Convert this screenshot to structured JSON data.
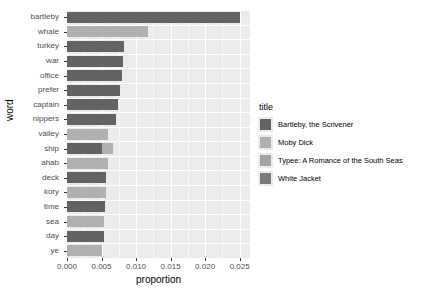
{
  "chart_data": {
    "type": "bar",
    "orientation": "horizontal",
    "stacked": true,
    "title": "",
    "xlabel": "proportion",
    "ylabel": "word",
    "xlim": [
      0,
      0.0265
    ],
    "xticks": [
      0.0,
      0.005,
      0.01,
      0.015,
      0.02,
      0.025
    ],
    "xticklabels": [
      "0.000",
      "0.005",
      "0.010",
      "0.015",
      "0.020",
      "0.025"
    ],
    "categories": [
      "bartleby",
      "whale",
      "turkey",
      "war",
      "office",
      "prefer",
      "captain",
      "nippers",
      "valley",
      "ship",
      "ahab",
      "deck",
      "kory",
      "time",
      "sea",
      "day",
      "ye"
    ],
    "legend_title": "title",
    "legend_position": "right",
    "grid": true,
    "panel_background": "#ebebeb",
    "series": [
      {
        "name": "Bartleby, the Scrivener",
        "color": "#636363",
        "values": [
          0.025,
          0,
          0.0083,
          0.00805,
          0.0079,
          0.00765,
          0.0074,
          0.00715,
          0,
          0.005,
          0,
          0.0057,
          0,
          0.00545,
          0,
          0.0053,
          0
        ]
      },
      {
        "name": "Moby Dick",
        "color": "#b0b0b0",
        "values": [
          0,
          0.0118,
          0,
          0,
          0,
          0,
          0,
          0,
          0.006,
          0.005,
          0.0059,
          0,
          0.0056,
          0,
          0.0054,
          0,
          0.00505
        ]
      },
      {
        "name": "Typee: A Romance of the South Seas",
        "color": "#a3a3a3",
        "values": [
          0,
          0,
          0,
          0,
          0,
          0,
          0,
          0,
          0,
          0,
          0,
          0,
          0,
          0,
          0,
          0,
          0
        ]
      },
      {
        "name": "White Jacket",
        "color": "#7a7a7a",
        "values": [
          0,
          0,
          0,
          0,
          0,
          0,
          0,
          0,
          0,
          0,
          0,
          0,
          0,
          0,
          0,
          0,
          0
        ]
      }
    ],
    "bars": [
      {
        "word": "bartleby",
        "segments": [
          {
            "series": "Bartleby, the Scrivener",
            "value": 0.025
          }
        ]
      },
      {
        "word": "whale",
        "segments": [
          {
            "series": "Moby Dick",
            "value": 0.0118
          }
        ]
      },
      {
        "word": "turkey",
        "segments": [
          {
            "series": "Bartleby, the Scrivener",
            "value": 0.0083
          }
        ]
      },
      {
        "word": "war",
        "segments": [
          {
            "series": "Bartleby, the Scrivener",
            "value": 0.00805
          }
        ]
      },
      {
        "word": "office",
        "segments": [
          {
            "series": "Bartleby, the Scrivener",
            "value": 0.0079
          }
        ]
      },
      {
        "word": "prefer",
        "segments": [
          {
            "series": "Bartleby, the Scrivener",
            "value": 0.00765
          }
        ]
      },
      {
        "word": "captain",
        "segments": [
          {
            "series": "Bartleby, the Scrivener",
            "value": 0.0074
          }
        ]
      },
      {
        "word": "nippers",
        "segments": [
          {
            "series": "Bartleby, the Scrivener",
            "value": 0.00715
          }
        ]
      },
      {
        "word": "valley",
        "segments": [
          {
            "series": "Moby Dick",
            "value": 0.006
          }
        ]
      },
      {
        "word": "ship",
        "segments": [
          {
            "series": "Bartleby, the Scrivener",
            "value": 0.005
          },
          {
            "series": "Moby Dick",
            "value": 0.0066
          }
        ]
      },
      {
        "word": "ahab",
        "segments": [
          {
            "series": "Moby Dick",
            "value": 0.0059
          }
        ]
      },
      {
        "word": "deck",
        "segments": [
          {
            "series": "Bartleby, the Scrivener",
            "value": 0.0057
          }
        ]
      },
      {
        "word": "kory",
        "segments": [
          {
            "series": "Moby Dick",
            "value": 0.0056
          }
        ]
      },
      {
        "word": "time",
        "segments": [
          {
            "series": "Bartleby, the Scrivener",
            "value": 0.00545
          }
        ]
      },
      {
        "word": "sea",
        "segments": [
          {
            "series": "Moby Dick",
            "value": 0.0054
          }
        ]
      },
      {
        "word": "day",
        "segments": [
          {
            "series": "Bartleby, the Scrivener",
            "value": 0.0053
          }
        ]
      },
      {
        "word": "ye",
        "segments": [
          {
            "series": "Moby Dick",
            "value": 0.00505
          }
        ]
      }
    ]
  },
  "legend": {
    "title": "title",
    "items": [
      {
        "label": "Bartleby, the Scrivener",
        "color": "#636363"
      },
      {
        "label": "Moby Dick",
        "color": "#b0b0b0"
      },
      {
        "label": "Typee: A Romance of the South Seas",
        "color": "#a3a3a3"
      },
      {
        "label": "White Jacket",
        "color": "#7a7a7a"
      }
    ]
  },
  "axes": {
    "x_title": "proportion",
    "y_title": "word"
  }
}
